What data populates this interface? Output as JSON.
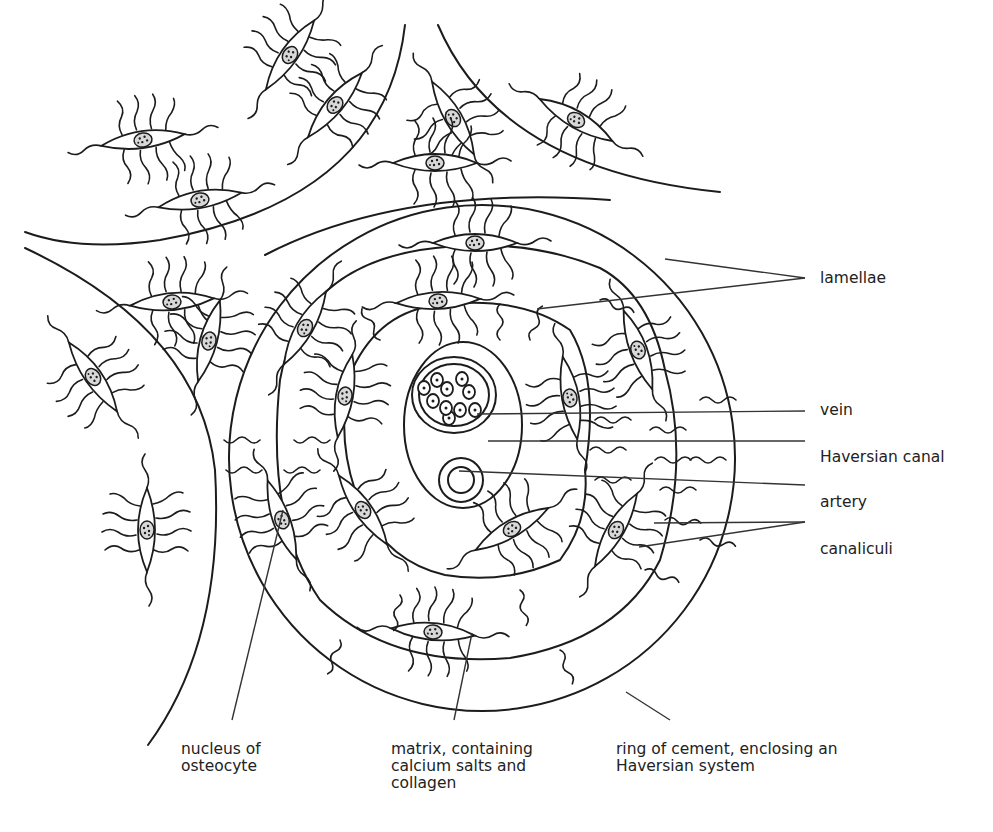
{
  "diagram": {
    "colors": {
      "line": "#1c1c1c",
      "leader": "#333333",
      "text": "#222222",
      "background": "#ffffff"
    }
  },
  "labels": {
    "lamellae": "lamellae",
    "vein": "vein",
    "haversian_canal": "Haversian canal",
    "artery": "artery",
    "canaliculi": "canaliculi",
    "nucleus_of_osteocyte": "nucleus of\nosteocyte",
    "matrix": "matrix, containing\ncalcium salts and\ncollagen",
    "ring_of_cement": "ring of cement, enclosing an\nHaversian system"
  }
}
